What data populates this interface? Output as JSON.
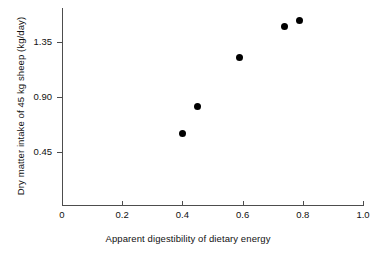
{
  "chart_data": {
    "type": "scatter",
    "title": "",
    "xlabel": "Apparent digestibility of dietary energy",
    "ylabel": "Dry matter intake of 45 kg sheep (kg/day)",
    "xlim": [
      0,
      1.0
    ],
    "ylim": [
      0,
      1.62
    ],
    "grid": false,
    "legend": null,
    "xticks": [
      0,
      0.2,
      0.4,
      0.6,
      0.8,
      1.0
    ],
    "xticklabels": [
      "0",
      "0.2",
      "0.4",
      "0.6",
      "0.8",
      "1.0"
    ],
    "yticks": [
      0.45,
      0.9,
      1.35
    ],
    "yticklabels": [
      "0.45",
      "0.90",
      "1.35"
    ],
    "marker": "filled-circle",
    "marker_color": "#000000",
    "points": [
      {
        "x": 0.4,
        "y": 0.6
      },
      {
        "x": 0.45,
        "y": 0.82
      },
      {
        "x": 0.59,
        "y": 1.22
      },
      {
        "x": 0.74,
        "y": 1.48
      },
      {
        "x": 0.79,
        "y": 1.53
      }
    ],
    "x": [
      0.4,
      0.45,
      0.59,
      0.74,
      0.79
    ],
    "values": [
      0.6,
      0.82,
      1.22,
      1.48,
      1.53
    ],
    "axis_color": "#4d4d4d",
    "text_color": "#111111",
    "background": "#ffffff"
  }
}
